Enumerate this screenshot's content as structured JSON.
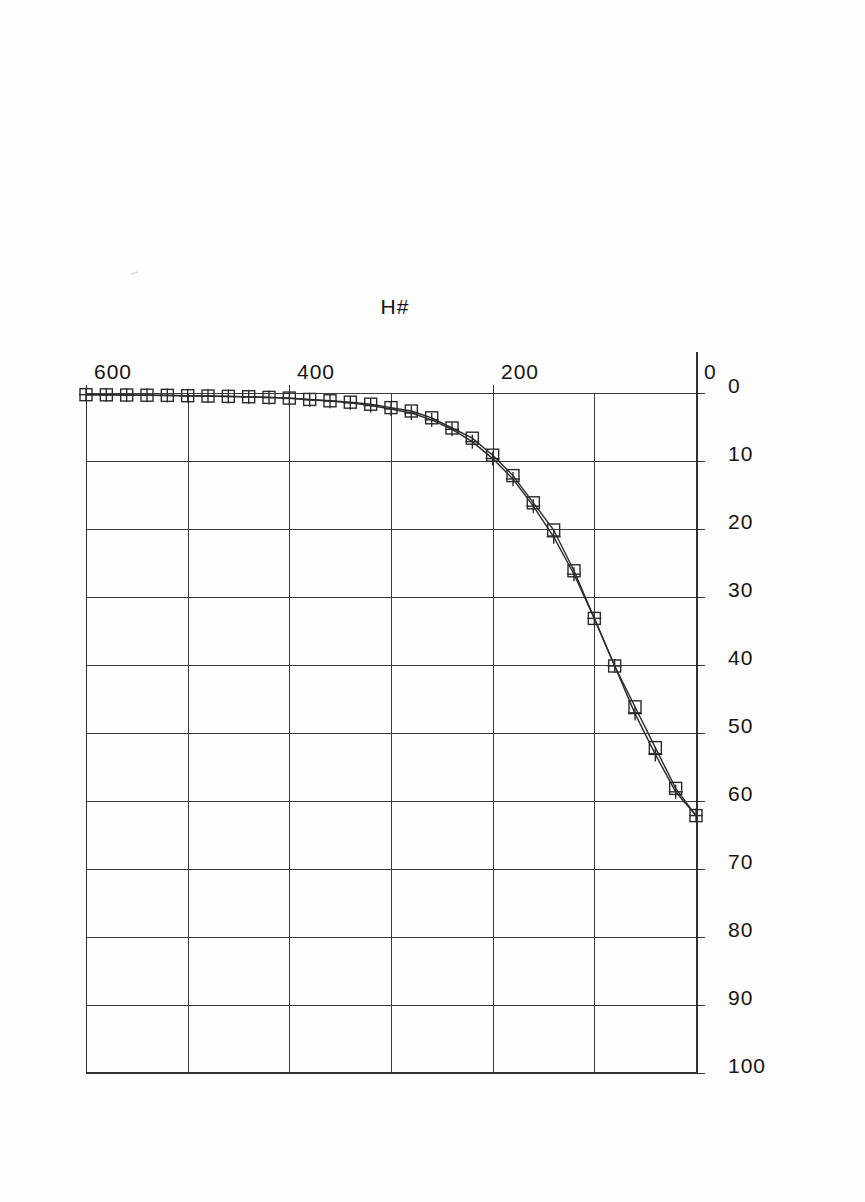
{
  "chart_data": {
    "type": "line",
    "title": "",
    "subtitle": "",
    "xlabel": "H#",
    "ylabel": "",
    "xlim": [
      0,
      600
    ],
    "ylim": [
      0,
      100
    ],
    "xticks": [
      0,
      200,
      400,
      600
    ],
    "xtick_labels": [
      "0",
      "200",
      "400",
      "600"
    ],
    "yticks": [
      0,
      10,
      20,
      30,
      40,
      50,
      60,
      70,
      80,
      90,
      100
    ],
    "ytick_labels": [
      "0",
      "10",
      "20",
      "30",
      "40",
      "50",
      "60",
      "70",
      "80",
      "90",
      "100"
    ],
    "x_minor_gridlines": [
      100,
      300,
      500
    ],
    "grid": true,
    "legend": null,
    "legend_position": "none",
    "orientation": "rotated-90-ccw",
    "x": [
      0,
      20,
      40,
      60,
      80,
      100,
      120,
      140,
      160,
      180,
      200,
      220,
      240,
      260,
      280,
      300,
      320,
      340,
      360,
      380,
      400,
      420,
      440,
      460,
      480,
      500,
      520,
      540,
      560,
      580,
      600
    ],
    "series": [
      {
        "name": "Series 1",
        "marker": "square",
        "values": [
          62,
          58,
          52,
          46,
          40,
          33,
          26,
          20,
          16,
          12,
          9,
          6.5,
          5,
          3.5,
          2.5,
          2,
          1.5,
          1.2,
          1,
          0.8,
          0.6,
          0.5,
          0.4,
          0.35,
          0.3,
          0.25,
          0.2,
          0.18,
          0.15,
          0.12,
          0.1
        ]
      },
      {
        "name": "Series 2",
        "marker": "plus",
        "values": [
          62,
          58.5,
          53,
          47,
          40,
          33,
          26.5,
          21,
          16.5,
          12.5,
          9.5,
          7,
          5.2,
          3.8,
          2.8,
          2.2,
          1.7,
          1.3,
          1.05,
          0.85,
          0.65,
          0.52,
          0.42,
          0.36,
          0.31,
          0.26,
          0.21,
          0.19,
          0.16,
          0.13,
          0.1
        ]
      }
    ]
  },
  "figure": {
    "axis_title": "H#"
  }
}
